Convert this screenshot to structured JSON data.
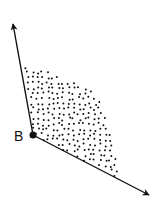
{
  "diagram": {
    "type": "angle-with-interior-region",
    "vertex": {
      "label": "B",
      "x": 33,
      "y": 135,
      "dot_radius": 3.5,
      "label_x": 14,
      "label_y": 141
    },
    "rays": [
      {
        "name": "upper-ray",
        "from": [
          33,
          135
        ],
        "to": [
          13,
          24
        ]
      },
      {
        "name": "lower-ray",
        "from": [
          33,
          135
        ],
        "to": [
          149,
          195
        ]
      }
    ],
    "interior_region": {
      "fill": "stippled-dots",
      "boundary": [
        [
          33,
          135
        ],
        [
          25,
          65
        ],
        [
          45,
          70
        ],
        [
          70,
          80
        ],
        [
          92,
          92
        ],
        [
          102,
          105
        ],
        [
          110,
          130
        ],
        [
          116,
          160
        ],
        [
          118,
          178
        ]
      ],
      "dot_count": 300,
      "dot_radius": 1.0,
      "seed": 7
    },
    "colors": {
      "stroke": "#111111",
      "dots": "#111111",
      "background": "#ffffff"
    }
  }
}
